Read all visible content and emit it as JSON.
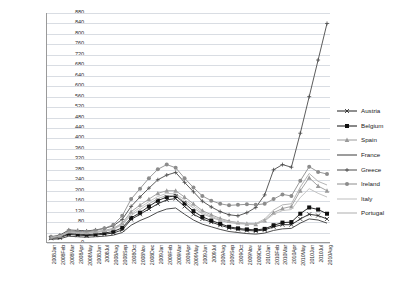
{
  "chart_data": {
    "type": "line",
    "title": "",
    "xlabel": "",
    "ylabel": "",
    "ylim": [
      0,
      880
    ],
    "ytick_step": 40,
    "grid": true,
    "legend_position": "right",
    "yticks": [
      880,
      840,
      800,
      760,
      720,
      680,
      640,
      600,
      560,
      520,
      480,
      440,
      400,
      360,
      320,
      280,
      240,
      200,
      160,
      120,
      80,
      40,
      0
    ],
    "categories": [
      "2008Jan",
      "2008Feb",
      "2008Mar",
      "2008Apr",
      "2008May",
      "2008Jun",
      "2008Jul",
      "2008Aug",
      "2008Sep",
      "2008Oct",
      "2008Nov",
      "2008Dec",
      "2009Jan",
      "2009Feb",
      "2009Mar",
      "2009Apr",
      "2009May",
      "2009Jun",
      "2009Jul",
      "2009Aug",
      "2009Sep",
      "2009Oct",
      "2009Nov",
      "2009Dec",
      "2010Jan",
      "2010Feb",
      "2010Mar",
      "2010Apr",
      "2010May",
      "2010Jun",
      "2010Jul",
      "2010Aug"
    ],
    "series": [
      {
        "name": "Austria",
        "color": "#1f1f1f",
        "marker": "x",
        "values": [
          18,
          20,
          33,
          30,
          28,
          30,
          34,
          38,
          50,
          90,
          110,
          130,
          150,
          165,
          170,
          140,
          110,
          92,
          80,
          68,
          58,
          52,
          48,
          46,
          50,
          62,
          70,
          70,
          92,
          110,
          105,
          92
        ]
      },
      {
        "name": "Belgium",
        "color": "#111111",
        "marker": "square",
        "values": [
          20,
          24,
          36,
          34,
          32,
          34,
          38,
          44,
          58,
          96,
          116,
          140,
          162,
          176,
          180,
          152,
          122,
          100,
          86,
          74,
          62,
          56,
          52,
          50,
          54,
          68,
          78,
          80,
          112,
          136,
          128,
          112
        ]
      },
      {
        "name": "Spain",
        "color": "#9a9a9a",
        "marker": "triangle",
        "values": [
          22,
          28,
          44,
          42,
          40,
          44,
          48,
          56,
          76,
          120,
          145,
          168,
          190,
          200,
          200,
          176,
          150,
          124,
          108,
          94,
          84,
          78,
          74,
          72,
          86,
          116,
          132,
          140,
          200,
          250,
          218,
          200
        ]
      },
      {
        "name": "France",
        "color": "#3a3a3a",
        "marker": "none",
        "values": [
          14,
          16,
          26,
          24,
          22,
          24,
          26,
          30,
          40,
          68,
          86,
          100,
          118,
          130,
          134,
          110,
          88,
          72,
          62,
          52,
          44,
          40,
          36,
          34,
          38,
          48,
          54,
          56,
          76,
          92,
          88,
          76
        ]
      },
      {
        "name": "Greece",
        "color": "#4a4a4a",
        "marker": "plus",
        "values": [
          24,
          30,
          50,
          48,
          46,
          50,
          56,
          66,
          90,
          140,
          176,
          210,
          242,
          260,
          270,
          232,
          196,
          160,
          138,
          120,
          108,
          104,
          116,
          136,
          184,
          280,
          300,
          290,
          420,
          560,
          700,
          840
        ]
      },
      {
        "name": "Ireland",
        "color": "#8c8c8c",
        "marker": "circle",
        "values": [
          20,
          26,
          46,
          44,
          42,
          48,
          56,
          70,
          104,
          168,
          208,
          248,
          282,
          300,
          288,
          248,
          212,
          180,
          162,
          150,
          144,
          146,
          148,
          146,
          150,
          168,
          186,
          180,
          238,
          292,
          272,
          264
        ]
      },
      {
        "name": "Italy",
        "color": "#bdbdbd",
        "marker": "none",
        "values": [
          22,
          28,
          42,
          40,
          38,
          42,
          46,
          54,
          72,
          112,
          136,
          158,
          178,
          190,
          188,
          166,
          142,
          118,
          102,
          90,
          82,
          78,
          74,
          72,
          84,
          110,
          124,
          128,
          174,
          208,
          190,
          176
        ]
      },
      {
        "name": "Portugal",
        "color": "#adadad",
        "marker": "none",
        "values": [
          20,
          25,
          40,
          38,
          36,
          40,
          44,
          52,
          70,
          106,
          128,
          150,
          170,
          182,
          182,
          158,
          134,
          112,
          98,
          86,
          78,
          74,
          72,
          74,
          92,
          126,
          146,
          150,
          214,
          266,
          236,
          222
        ]
      }
    ]
  }
}
